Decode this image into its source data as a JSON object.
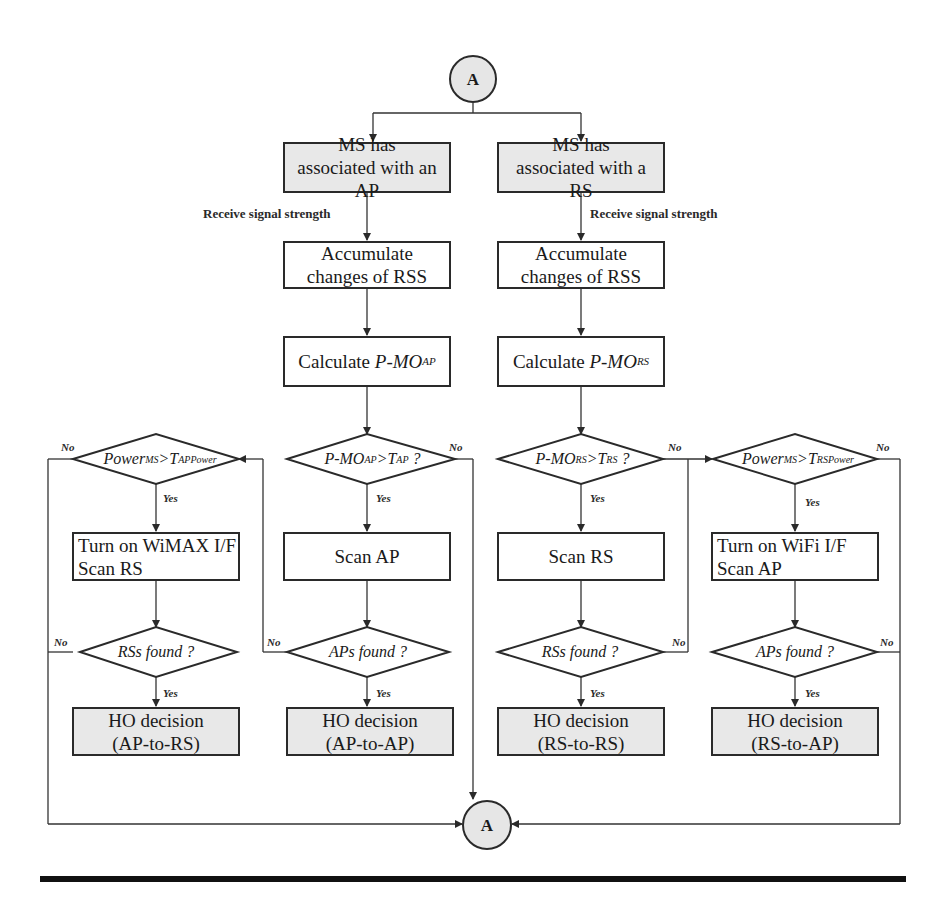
{
  "diagram": {
    "type": "flowchart",
    "connector_top": {
      "label": "A"
    },
    "connector_bottom": {
      "label": "A"
    },
    "branches": {
      "ap": {
        "start": "MS has associated with an AP",
        "edge_label": "Receive signal strength",
        "accumulate": "Accumulate changes of RSS",
        "calculate_prefix": "Calculate ",
        "calculate_var": "P-MO",
        "calculate_sub": "AP",
        "decision": {
          "lhs": "P-MO",
          "lhs_sub": "AP",
          "op": ">",
          "rhs": "T",
          "rhs_sub": "AP",
          "suffix": " ?"
        },
        "scan": "Scan AP",
        "found": "APs found ?",
        "ho": "HO decision (AP-to-AP)",
        "power_decision": {
          "lhs": "Power",
          "lhs_sub": "MS",
          "op": ">",
          "rhs": "T",
          "rhs_sub": "APPower"
        },
        "turn_on": [
          "Turn on WiMAX I/F",
          "Scan RS"
        ],
        "found_alt": "RSs found ?",
        "ho_alt": "HO decision (AP-to-RS)"
      },
      "rs": {
        "start": "MS has associated with a RS",
        "edge_label": "Receive signal strength",
        "accumulate": "Accumulate changes of RSS",
        "calculate_prefix": "Calculate ",
        "calculate_var": "P-MO",
        "calculate_sub": "RS",
        "decision": {
          "lhs": "P-MO",
          "lhs_sub": "RS",
          "op": ">",
          "rhs": "T",
          "rhs_sub": "RS",
          "suffix": " ?"
        },
        "scan": "Scan RS",
        "found": "RSs found ?",
        "ho": "HO decision (RS-to-RS)",
        "power_decision": {
          "lhs": "Power",
          "lhs_sub": "MS",
          "op": ">",
          "rhs": "T",
          "rhs_sub": "RSPower"
        },
        "turn_on": [
          "Turn on WiFi I/F",
          "Scan AP"
        ],
        "found_alt": "APs found ?",
        "ho_alt": "HO decision (RS-to-AP)"
      }
    },
    "edge_labels": {
      "yes": "Yes",
      "no": "No"
    },
    "colors": {
      "terminal_fill": "#e8e8e8",
      "line": "#2a2a2a",
      "background": "#ffffff"
    }
  }
}
